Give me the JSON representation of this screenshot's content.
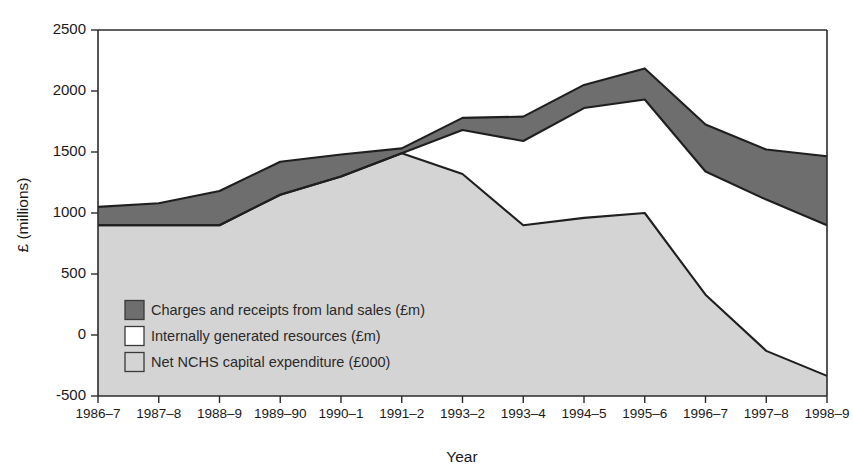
{
  "chart_data": {
    "type": "area",
    "stacked": true,
    "title": "",
    "xlabel": "Year",
    "ylabel": "£ (millions)",
    "ylim": [
      -500,
      2500
    ],
    "ytick_values": [
      -500,
      0,
      500,
      1000,
      1500,
      2000,
      2500
    ],
    "ytick_labels": [
      "-500",
      "0",
      "500",
      "1000",
      "1500",
      "2000",
      "2500"
    ],
    "grid": false,
    "legend_position": "inside-lower-left",
    "categories": [
      "1986–7",
      "1987–8",
      "1988–9",
      "1989–90",
      "1990–1",
      "1991–2",
      "1993–2",
      "1993–4",
      "1994–5",
      "1995–6",
      "1996–7",
      "1997–8",
      "1998–9"
    ],
    "series": [
      {
        "name": "Net NCHS capital expenditure (£000)",
        "color": "#d4d4d4",
        "order": 0,
        "values": [
          900,
          900,
          900,
          1150,
          1300,
          1490,
          1320,
          900,
          960,
          1000,
          330,
          -130,
          -335
        ]
      },
      {
        "name": "Internally generated resources (£m)",
        "color": "#ffffff",
        "order": 1,
        "values": [
          0,
          0,
          0,
          0,
          0,
          0,
          360,
          690,
          900,
          930,
          1010,
          1240,
          1235
        ]
      },
      {
        "name": "Charges and receipts from land sales (£m)",
        "color": "#6e6e6e",
        "order": 2,
        "values": [
          150,
          180,
          280,
          270,
          180,
          40,
          100,
          200,
          190,
          255,
          385,
          410,
          565
        ]
      }
    ],
    "cumulative_tops": {
      "lower_band_top": [
        900,
        900,
        900,
        1150,
        1300,
        1490,
        1320,
        900,
        960,
        1000,
        330,
        -130,
        -335
      ],
      "middle_band_top": [
        900,
        900,
        900,
        1150,
        1300,
        1490,
        1680,
        1590,
        1860,
        1930,
        1340,
        1110,
        900
      ],
      "upper_band_top": [
        1050,
        1080,
        1180,
        1420,
        1480,
        1530,
        1780,
        1790,
        2050,
        2185,
        1725,
        1520,
        1465
      ]
    },
    "legend_entries": [
      {
        "label": "Charges and receipts from land sales (£m)",
        "color": "#6e6e6e"
      },
      {
        "label": "Internally generated resources (£m)",
        "color": "#ffffff"
      },
      {
        "label": "Net NCHS capital expenditure (£000)",
        "color": "#d4d4d4"
      }
    ]
  }
}
